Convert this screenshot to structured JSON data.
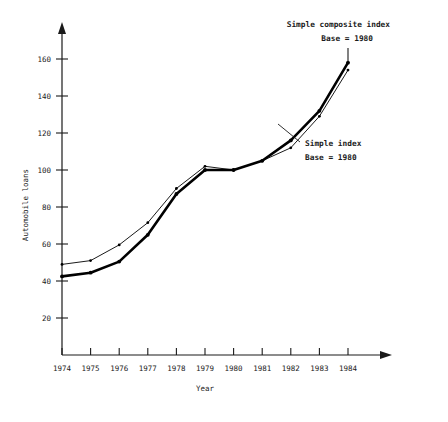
{
  "chart_data": {
    "type": "line",
    "title": "",
    "xlabel": "Year",
    "ylabel": "Automobile loans",
    "categories": [
      1974,
      1975,
      1976,
      1977,
      1978,
      1979,
      1980,
      1981,
      1982,
      1983,
      1984
    ],
    "xtick_labels": [
      "1974",
      "1975",
      "1976",
      "1977",
      "1978",
      "1979",
      "1980",
      "1981",
      "1982",
      "1983",
      "1984"
    ],
    "ytick_labels": [
      "20",
      "40",
      "60",
      "80",
      "100",
      "120",
      "140",
      "160"
    ],
    "yticks": [
      20,
      40,
      60,
      80,
      100,
      120,
      140,
      160
    ],
    "ylim": [
      0,
      172
    ],
    "xlim": [
      1974,
      1984
    ],
    "grid": false,
    "legend": "annotations",
    "series": [
      {
        "name": "Simple composite index",
        "style": "thick",
        "color": "#000000",
        "values": [
          42.5,
          44.5,
          50.5,
          65,
          87,
          100,
          100,
          105,
          116,
          132,
          158
        ]
      },
      {
        "name": "Simple index",
        "style": "thin",
        "color": "#000000",
        "values": [
          49,
          51,
          59.5,
          71.5,
          90,
          102,
          100,
          105,
          112,
          129,
          154
        ]
      }
    ],
    "annotations": [
      {
        "id": "composite-annotation",
        "line1": "Simple composite index",
        "line2": "Base = 1980",
        "target_year": 1984,
        "target_value": 158
      },
      {
        "id": "simple-annotation",
        "line1": "Simple index",
        "line2": "Base = 1980",
        "target_year": 1982,
        "target_value": 112
      }
    ]
  },
  "axes": {
    "y_label": "Automobile loans",
    "x_label": "Year"
  }
}
